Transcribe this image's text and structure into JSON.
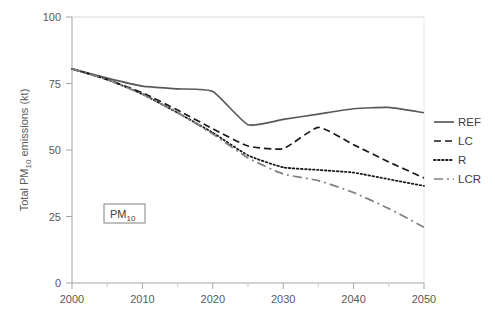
{
  "chart_data": {
    "type": "line",
    "title": "",
    "subtitle": "",
    "xlabel": "",
    "ylabel": "Total PM10 emissions (kt)",
    "ylabel_parts": {
      "pre": "Total PM",
      "sub": "10",
      "post": " emissions (kt)"
    },
    "xlim": [
      2000,
      2050
    ],
    "ylim": [
      0,
      100
    ],
    "yticks": [
      0,
      25,
      50,
      75,
      100
    ],
    "ytick_labels": [
      "0",
      "25",
      "50",
      "75",
      "100"
    ],
    "xticks": [
      2000,
      2010,
      2020,
      2030,
      2040,
      2050
    ],
    "xtick_labels": [
      "2000",
      "2010",
      "2020",
      "2030",
      "2040",
      "2050"
    ],
    "x_minor_tick_interval": 5,
    "grid": false,
    "legend_position": "right",
    "annotation": {
      "text": "PM10",
      "text_pre": "PM",
      "text_sub": "10",
      "boxed": true
    },
    "x": [
      2000,
      2005,
      2010,
      2015,
      2020,
      2025,
      2030,
      2035,
      2040,
      2045,
      2050
    ],
    "series": [
      {
        "name": "REF",
        "label": "REF",
        "style": "solid",
        "color": "#595959",
        "values": [
          80.5,
          77.0,
          74.0,
          73.0,
          72.0,
          59.5,
          61.5,
          63.5,
          65.5,
          66.0,
          64.0
        ]
      },
      {
        "name": "LC",
        "label": "LC",
        "style": "dashed",
        "color": "#1a1a1a",
        "values": [
          80.5,
          76.5,
          71.5,
          65.0,
          58.0,
          51.5,
          50.5,
          58.5,
          52.0,
          45.5,
          39.5
        ]
      },
      {
        "name": "R",
        "label": "R",
        "style": "dotted",
        "color": "#1a1a1a",
        "values": [
          80.5,
          76.5,
          71.0,
          64.0,
          56.5,
          48.0,
          43.5,
          42.5,
          41.5,
          39.0,
          36.5
        ]
      },
      {
        "name": "LCR",
        "label": "LCR",
        "style": "dashdot",
        "color": "#808080",
        "values": [
          80.5,
          76.5,
          71.0,
          64.0,
          56.0,
          47.0,
          41.0,
          38.5,
          34.0,
          28.0,
          21.0
        ]
      }
    ]
  },
  "legend": {
    "items": [
      {
        "label": "REF"
      },
      {
        "label": "LC"
      },
      {
        "label": "R"
      },
      {
        "label": "LCR"
      }
    ]
  },
  "axes": {
    "y_title": "Total PM10 emissions (kt)",
    "y_title_pre": "Total PM",
    "y_title_sub": "10",
    "y_title_post": " emissions (kt)"
  },
  "colors": {
    "axis": "#a6a6a6",
    "tick_text": "#595959",
    "ref": "#595959",
    "lc": "#1a1a1a",
    "r": "#1a1a1a",
    "lcr": "#808080",
    "annotation_border": "#808080",
    "background": "#ffffff"
  }
}
